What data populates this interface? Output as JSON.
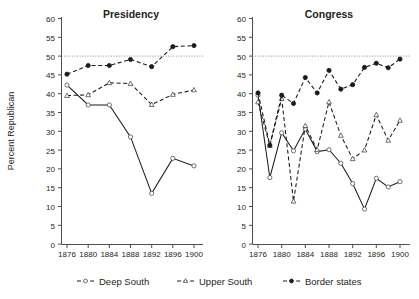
{
  "figure": {
    "y_axis_label": "Percent Republican",
    "y_ticks": [
      "0",
      "5",
      "10",
      "15",
      "20",
      "25",
      "30",
      "35",
      "40",
      "45",
      "50",
      "55",
      "60"
    ],
    "x_ticks": [
      "1876",
      "1880",
      "1884",
      "1888",
      "1892",
      "1896",
      "1900"
    ],
    "reference_line_value": 50,
    "legend": [
      {
        "label": "Deep South",
        "marker": "open-circle",
        "style": "dashed"
      },
      {
        "label": "Upper South",
        "marker": "open-triangle",
        "style": "dashed"
      },
      {
        "label": "Border states",
        "marker": "filled-circle",
        "style": "dashed"
      }
    ]
  },
  "chart_data": [
    {
      "type": "line",
      "title": "Presidency",
      "xlabel": "",
      "ylabel": "Percent Republican",
      "ylim": [
        0,
        60
      ],
      "xlim": [
        1876,
        1900
      ],
      "grid": false,
      "reference_lines": [
        {
          "y": 50,
          "style": "dotted"
        }
      ],
      "legend_position": "bottom",
      "x": [
        1876,
        1880,
        1884,
        1888,
        1892,
        1896,
        1900
      ],
      "series": [
        {
          "name": "Deep South",
          "marker": "open-circle",
          "style": "solid",
          "values": [
            42.3,
            37.0,
            37.0,
            28.5,
            13.5,
            22.8,
            20.8
          ]
        },
        {
          "name": "Upper South",
          "marker": "open-triangle",
          "style": "dashed",
          "values": [
            39.5,
            39.7,
            42.9,
            42.7,
            37.1,
            39.8,
            41.0
          ]
        },
        {
          "name": "Border states",
          "marker": "filled-circle",
          "style": "dashed",
          "values": [
            45.2,
            47.5,
            47.5,
            49.1,
            47.2,
            52.5,
            52.8
          ]
        }
      ]
    },
    {
      "type": "line",
      "title": "Congress",
      "xlabel": "",
      "ylabel": "Percent Republican",
      "ylim": [
        0,
        60
      ],
      "xlim": [
        1876,
        1900
      ],
      "grid": false,
      "reference_lines": [
        {
          "y": 50,
          "style": "dotted"
        }
      ],
      "legend_position": "bottom",
      "x": [
        1876,
        1878,
        1880,
        1882,
        1884,
        1886,
        1888,
        1890,
        1892,
        1894,
        1896,
        1898,
        1900
      ],
      "series": [
        {
          "name": "Deep South",
          "marker": "open-circle",
          "style": "solid",
          "values": [
            39.6,
            17.7,
            29.6,
            24.8,
            30.6,
            24.6,
            25.1,
            21.5,
            16.1,
            9.3,
            17.5,
            15.2,
            16.6
          ]
        },
        {
          "name": "Upper South",
          "marker": "open-triangle",
          "style": "dashed",
          "values": [
            37.8,
            26.2,
            38.7,
            11.4,
            31.5,
            25.1,
            37.8,
            28.9,
            22.7,
            25.0,
            34.4,
            27.6,
            32.9
          ]
        },
        {
          "name": "Border states",
          "marker": "filled-circle",
          "style": "dashed",
          "values": [
            40.2,
            26.3,
            39.6,
            37.4,
            44.3,
            40.2,
            46.2,
            41.2,
            42.4,
            47.0,
            48.1,
            46.9,
            49.2
          ]
        }
      ]
    }
  ]
}
